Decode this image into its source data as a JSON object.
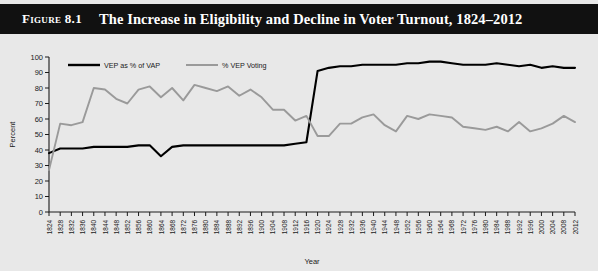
{
  "figure": {
    "label": "Figure 8.1",
    "title": "The Increase in Eligibility and Decline in Voter Turnout, 1824–2012",
    "title_bar_color": "#111111",
    "background_color": "#e8e8e8"
  },
  "legend": {
    "position": "top-left-inside",
    "items": [
      {
        "name": "VEP as % of VAP",
        "color": "#000000"
      },
      {
        "name": "% VEP Voting",
        "color": "#9a9a9a"
      }
    ]
  },
  "chart_data": {
    "type": "line",
    "title": "The Increase in Eligibility and Decline in Voter Turnout, 1824–2012",
    "xlabel": "Year",
    "ylabel": "Percent",
    "ylim": [
      0,
      100
    ],
    "ytick_step": 10,
    "yticks": [
      0,
      10,
      20,
      30,
      40,
      50,
      60,
      70,
      80,
      90,
      100
    ],
    "grid": false,
    "legend_position": "top-left-inside",
    "categories": [
      "1824",
      "1828",
      "1832",
      "1836",
      "1840",
      "1844",
      "1848",
      "1852",
      "1856",
      "1860",
      "1864",
      "1868",
      "1872",
      "1876",
      "1880",
      "1884",
      "1888",
      "1892",
      "1896",
      "1900",
      "1904",
      "1908",
      "1912",
      "1916",
      "1920",
      "1924",
      "1928",
      "1932",
      "1936",
      "1940",
      "1944",
      "1948",
      "1952",
      "1956",
      "1960",
      "1964",
      "1968",
      "1972",
      "1976",
      "1980",
      "1984",
      "1988",
      "1992",
      "1996",
      "2000",
      "2004",
      "2008",
      "2012"
    ],
    "series": [
      {
        "name": "VEP as % of VAP",
        "color": "#000000",
        "values": [
          38,
          41,
          41,
          41,
          42,
          42,
          42,
          42,
          43,
          43,
          36,
          42,
          43,
          43,
          43,
          43,
          43,
          43,
          43,
          43,
          43,
          43,
          44,
          45,
          91,
          93,
          94,
          94,
          95,
          95,
          95,
          95,
          96,
          96,
          97,
          97,
          96,
          95,
          95,
          95,
          96,
          95,
          94,
          95,
          93,
          94,
          93,
          93
        ]
      },
      {
        "name": "% VEP Voting",
        "color": "#9a9a9a",
        "values": [
          27,
          57,
          56,
          58,
          80,
          79,
          73,
          70,
          79,
          81,
          74,
          80,
          72,
          82,
          80,
          78,
          81,
          75,
          79,
          74,
          66,
          66,
          59,
          62,
          49,
          49,
          57,
          57,
          61,
          63,
          56,
          52,
          62,
          60,
          63,
          62,
          61,
          55,
          54,
          53,
          55,
          52,
          58,
          52,
          54,
          57,
          62,
          58
        ]
      }
    ]
  }
}
